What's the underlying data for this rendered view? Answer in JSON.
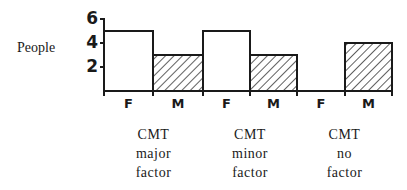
{
  "chart_data": {
    "type": "bar",
    "title": "",
    "xlabel": "",
    "ylabel": "People",
    "ylim": [
      0,
      6
    ],
    "yticks": [
      2,
      4,
      6
    ],
    "grid": false,
    "categories": [
      "CMT major factor",
      "CMT minor factor",
      "CMT no factor"
    ],
    "category_labels": [
      [
        "CMT",
        "major",
        "factor"
      ],
      [
        "CMT",
        "minor",
        "factor"
      ],
      [
        "CMT",
        "no",
        "factor"
      ]
    ],
    "series": [
      {
        "name": "F",
        "pattern": "white",
        "values": [
          5,
          5,
          0
        ]
      },
      {
        "name": "M",
        "pattern": "diagonal-hatch",
        "values": [
          3,
          3,
          4
        ]
      }
    ],
    "x_tick_labels": [
      "F",
      "M",
      "F",
      "M",
      "F",
      "M"
    ]
  },
  "axis": {
    "ylabel": "People",
    "yticks": [
      "6",
      "4",
      "2"
    ]
  }
}
